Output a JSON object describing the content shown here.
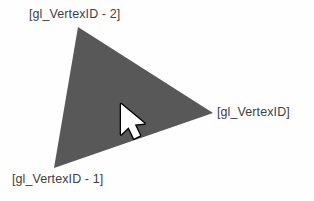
{
  "figure": {
    "background_color": "#fefefe",
    "triangle": {
      "fill_color": "#585858",
      "points": "78,27 213,113 54,168",
      "vertices": [
        {
          "id": "top",
          "x": 78,
          "y": 27
        },
        {
          "id": "right",
          "x": 213,
          "y": 113
        },
        {
          "id": "bottom_left",
          "x": 54,
          "y": 168
        }
      ]
    },
    "labels": {
      "text_color": "#3f3f3f",
      "top": "[gl_VertexID - 2]",
      "right": "[gl_VertexID]",
      "bottom_left": "[gl_VertexID - 1]"
    },
    "cursor": {
      "kind": "arrow-pointer",
      "tip_x": 122,
      "tip_y": 105,
      "fill_color": "#ffffff",
      "outline_color": "#000000"
    }
  }
}
